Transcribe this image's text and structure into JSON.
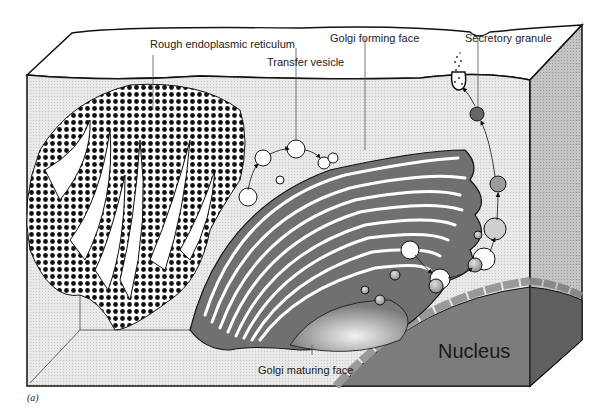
{
  "figure": {
    "panel_label": "(a)",
    "labels": {
      "rough_er": "Rough endoplasmic reticulum",
      "transfer_vesicle": "Transfer vesicle",
      "golgi_forming_face": "Golgi forming face",
      "secretory_granule": "Secretory granule",
      "golgi_maturing_face": "Golgi maturing face",
      "nucleus": "Nucleus"
    },
    "colors": {
      "background": "#ffffff",
      "cytoplasm": "#e6e6e6",
      "side_panel": "#bdbdbd",
      "nucleus": "#7a7a7a",
      "nucleus_side": "#5e5e5e",
      "golgi_cisterna": "#6e6e6e",
      "outline": "#111111"
    }
  }
}
